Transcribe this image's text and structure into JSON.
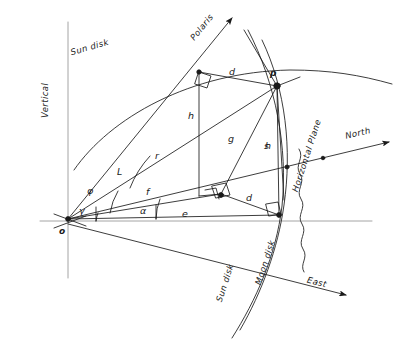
{
  "figure": {
    "type": "hand-drawn geometric diagram",
    "title_visible": false,
    "background_color": "#ffffff",
    "ink_color": "#1a1a1a",
    "axis_color": "#8a8a8a",
    "width": 406,
    "height": 363
  },
  "labels": {
    "sun_disk_upper": "Sun disk",
    "sun_disk_lower": "Sun disk",
    "moon_disk": "Moon disk",
    "vertical": "Vertical",
    "polaris": "Polaris",
    "north": "North",
    "east": "East",
    "horizontal_plane": "Horizontal Plane",
    "point_origin": "o",
    "point_p": "p",
    "seg_h_left": "h",
    "seg_h_right": "h",
    "seg_r": "r",
    "seg_f": "f",
    "seg_e": "e",
    "seg_d_upper": "d",
    "seg_d_lower": "d",
    "seg_g": "g",
    "seg_s": "s",
    "angle_L": "L",
    "angle_phi": "φ",
    "angle_gamma": "γ",
    "angle_alpha": "α"
  },
  "geometry": {
    "origin": [
      68,
      219
    ],
    "p": [
      277,
      86
    ],
    "apex": [
      199,
      72
    ],
    "base_center": [
      221,
      194
    ],
    "foot_right": [
      279,
      215
    ],
    "horizon_left": [
      40,
      221
    ],
    "horizon_right": [
      372,
      221
    ],
    "vertical_top": [
      68,
      22
    ],
    "vertical_bottom": [
      68,
      278
    ],
    "polaris_tip": [
      232,
      18
    ],
    "north_tip": [
      389,
      142
    ],
    "east_tip": [
      346,
      295
    ]
  }
}
